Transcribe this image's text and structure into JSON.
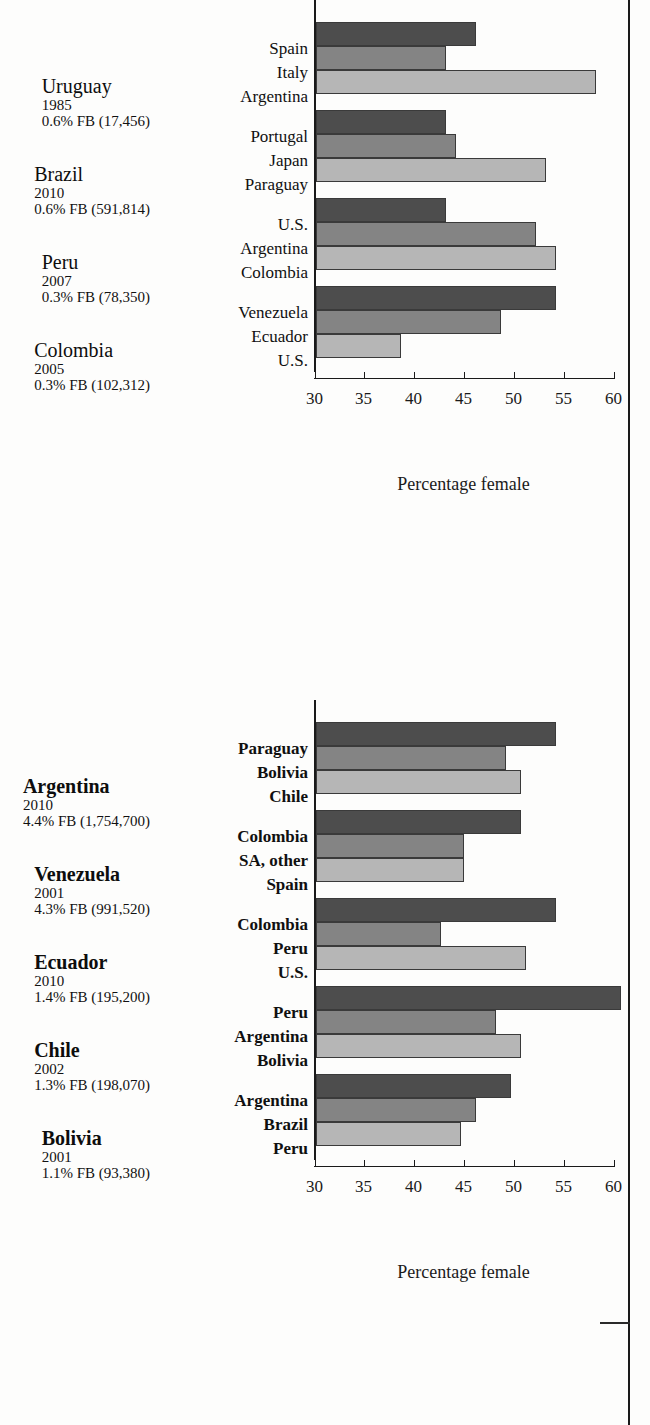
{
  "chart_data": [
    {
      "id": "top",
      "type": "bar",
      "title": "",
      "xlabel": "",
      "ylabel": "Percentage female",
      "ylim": [
        30,
        60
      ],
      "ytick_labels": [
        "30",
        "35",
        "40",
        "45",
        "50",
        "55",
        "60"
      ],
      "yticks": [
        30,
        35,
        40,
        45,
        50,
        55,
        60
      ],
      "grid": false,
      "legend": "none",
      "groups": [
        {
          "country": "Uruguay",
          "year": "1985",
          "fb": "0.6% FB (17,456)",
          "bold": false,
          "categories": [
            "Spain",
            "Italy",
            "Argentina"
          ],
          "values": [
            46.0,
            43.0,
            58.0
          ]
        },
        {
          "country": "Brazil",
          "year": "2010",
          "fb": "0.6% FB (591,814)",
          "bold": false,
          "categories": [
            "Portugal",
            "Japan",
            "Paraguay"
          ],
          "values": [
            43.0,
            44.0,
            53.0
          ]
        },
        {
          "country": "Peru",
          "year": "2007",
          "fb": "0.3% FB (78,350)",
          "bold": false,
          "categories": [
            "U.S.",
            "Argentina",
            "Colombia"
          ],
          "values": [
            43.0,
            52.0,
            54.0
          ]
        },
        {
          "country": "Colombia",
          "year": "2005",
          "fb": "0.3% FB (102,312)",
          "bold": false,
          "categories": [
            "Venezuela",
            "Ecuador",
            "U.S."
          ],
          "values": [
            54.0,
            48.5,
            38.5
          ]
        }
      ]
    },
    {
      "id": "bottom",
      "type": "bar",
      "title": "",
      "xlabel": "",
      "ylabel": "Percentage female",
      "ylim": [
        30,
        60
      ],
      "ytick_labels": [
        "30",
        "35",
        "40",
        "45",
        "50",
        "55",
        "60"
      ],
      "yticks": [
        30,
        35,
        40,
        45,
        50,
        55,
        60
      ],
      "grid": false,
      "legend": "none",
      "groups": [
        {
          "country": "Argentina",
          "year": "2010",
          "fb": "4.4% FB (1,754,700)",
          "bold": true,
          "categories": [
            "Paraguay",
            "Bolivia",
            "Chile"
          ],
          "values": [
            54.0,
            49.0,
            50.5
          ]
        },
        {
          "country": "Venezuela",
          "year": "2001",
          "fb": "4.3% FB (991,520)",
          "bold": true,
          "categories": [
            "Colombia",
            "SA, other",
            "Spain"
          ],
          "values": [
            50.5,
            44.8,
            44.8
          ]
        },
        {
          "country": "Ecuador",
          "year": "2010",
          "fb": "1.4% FB (195,200)",
          "bold": true,
          "categories": [
            "Colombia",
            "Peru",
            "U.S."
          ],
          "values": [
            54.0,
            42.5,
            51.0
          ]
        },
        {
          "country": "Chile",
          "year": "2002",
          "fb": "1.3% FB (198,070)",
          "bold": true,
          "categories": [
            "Peru",
            "Argentina",
            "Bolivia"
          ],
          "values": [
            60.5,
            48.0,
            50.5
          ]
        },
        {
          "country": "Bolivia",
          "year": "2001",
          "fb": "1.1% FB (93,380)",
          "bold": true,
          "categories": [
            "Argentina",
            "Brazil",
            "Peru"
          ],
          "values": [
            49.5,
            46.0,
            44.5
          ]
        }
      ]
    }
  ],
  "series_colors": [
    "#4d4d4d",
    "#848484",
    "#b6b6b6"
  ]
}
